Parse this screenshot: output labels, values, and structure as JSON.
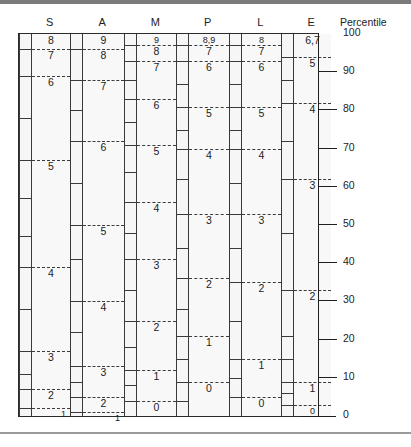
{
  "chart_data": {
    "type": "table",
    "title": "",
    "axis_title": "Percentile",
    "ylabel": "Percentile",
    "ylim": [
      0,
      100
    ],
    "yticks": [
      0,
      10,
      20,
      30,
      40,
      50,
      60,
      70,
      80,
      90,
      100
    ],
    "ytick_labels": [
      "0",
      "10",
      "20",
      "30",
      "40",
      "50",
      "60",
      "70",
      "80",
      "90",
      "100"
    ],
    "grid": false,
    "legend": "none",
    "categories": [
      "S",
      "A",
      "M",
      "P",
      "L",
      "E"
    ],
    "series": [
      {
        "name": "S",
        "bands": [
          {
            "label": "8",
            "top_pct": 100,
            "bottom_pct": 96
          },
          {
            "label": "7",
            "top_pct": 96,
            "bottom_pct": 89
          },
          {
            "label": "6",
            "top_pct": 89,
            "bottom_pct": 67
          },
          {
            "label": "5",
            "top_pct": 67,
            "bottom_pct": 39
          },
          {
            "label": "4",
            "top_pct": 39,
            "bottom_pct": 17
          },
          {
            "label": "3",
            "top_pct": 17,
            "bottom_pct": 7
          },
          {
            "label": "2",
            "top_pct": 7,
            "bottom_pct": 2
          },
          {
            "label": "1",
            "top_pct": 2,
            "bottom_pct": 0
          }
        ]
      },
      {
        "name": "A",
        "bands": [
          {
            "label": "9",
            "top_pct": 100,
            "bottom_pct": 96
          },
          {
            "label": "8",
            "top_pct": 96,
            "bottom_pct": 88
          },
          {
            "label": "7",
            "top_pct": 88,
            "bottom_pct": 72
          },
          {
            "label": "6",
            "top_pct": 72,
            "bottom_pct": 50
          },
          {
            "label": "5",
            "top_pct": 50,
            "bottom_pct": 30
          },
          {
            "label": "4",
            "top_pct": 30,
            "bottom_pct": 13
          },
          {
            "label": "3",
            "top_pct": 13,
            "bottom_pct": 5
          },
          {
            "label": "2",
            "top_pct": 5,
            "bottom_pct": 1
          },
          {
            "label": "1",
            "top_pct": 1,
            "bottom_pct": 0
          }
        ]
      },
      {
        "name": "M",
        "bands": [
          {
            "label": "9",
            "top_pct": 100,
            "bottom_pct": 97
          },
          {
            "label": "8",
            "top_pct": 97,
            "bottom_pct": 93
          },
          {
            "label": "7",
            "top_pct": 93,
            "bottom_pct": 83
          },
          {
            "label": "6",
            "top_pct": 83,
            "bottom_pct": 71
          },
          {
            "label": "5",
            "top_pct": 71,
            "bottom_pct": 56
          },
          {
            "label": "4",
            "top_pct": 56,
            "bottom_pct": 41
          },
          {
            "label": "3",
            "top_pct": 41,
            "bottom_pct": 25
          },
          {
            "label": "2",
            "top_pct": 25,
            "bottom_pct": 12
          },
          {
            "label": "1",
            "top_pct": 12,
            "bottom_pct": 4
          },
          {
            "label": "0",
            "top_pct": 4,
            "bottom_pct": 0
          }
        ]
      },
      {
        "name": "P",
        "bands": [
          {
            "label": "8,9",
            "top_pct": 100,
            "bottom_pct": 97
          },
          {
            "label": "7",
            "top_pct": 97,
            "bottom_pct": 93
          },
          {
            "label": "6",
            "top_pct": 93,
            "bottom_pct": 81
          },
          {
            "label": "5",
            "top_pct": 81,
            "bottom_pct": 70
          },
          {
            "label": "4",
            "top_pct": 70,
            "bottom_pct": 53
          },
          {
            "label": "3",
            "top_pct": 53,
            "bottom_pct": 36
          },
          {
            "label": "2",
            "top_pct": 36,
            "bottom_pct": 21
          },
          {
            "label": "1",
            "top_pct": 21,
            "bottom_pct": 9
          },
          {
            "label": "0",
            "top_pct": 9,
            "bottom_pct": 0
          }
        ]
      },
      {
        "name": "L",
        "bands": [
          {
            "label": "8",
            "top_pct": 100,
            "bottom_pct": 97
          },
          {
            "label": "7",
            "top_pct": 97,
            "bottom_pct": 93
          },
          {
            "label": "6",
            "top_pct": 93,
            "bottom_pct": 81
          },
          {
            "label": "5",
            "top_pct": 81,
            "bottom_pct": 70
          },
          {
            "label": "4",
            "top_pct": 70,
            "bottom_pct": 53
          },
          {
            "label": "3",
            "top_pct": 53,
            "bottom_pct": 35
          },
          {
            "label": "2",
            "top_pct": 35,
            "bottom_pct": 15
          },
          {
            "label": "1",
            "top_pct": 15,
            "bottom_pct": 5
          },
          {
            "label": "0",
            "top_pct": 5,
            "bottom_pct": 0
          }
        ]
      },
      {
        "name": "E",
        "bands": [
          {
            "label": "6,7",
            "top_pct": 100,
            "bottom_pct": 94
          },
          {
            "label": "5",
            "top_pct": 94,
            "bottom_pct": 82
          },
          {
            "label": "4",
            "top_pct": 82,
            "bottom_pct": 62
          },
          {
            "label": "3",
            "top_pct": 62,
            "bottom_pct": 33
          },
          {
            "label": "2",
            "top_pct": 33,
            "bottom_pct": 9
          },
          {
            "label": "1",
            "top_pct": 9,
            "bottom_pct": 3
          },
          {
            "label": "0",
            "top_pct": 3,
            "bottom_pct": 0
          }
        ]
      }
    ],
    "tick_strip_marks_pct": {
      "S": [
        96,
        89,
        78,
        67,
        57,
        47,
        39,
        28,
        17,
        11,
        7,
        2
      ],
      "A": [
        96,
        88,
        80,
        72,
        61,
        50,
        41,
        30,
        22,
        13,
        9,
        5,
        1
      ],
      "M": [
        97,
        93,
        88,
        83,
        77,
        71,
        64,
        56,
        48,
        41,
        33,
        25,
        18,
        12,
        8,
        4
      ],
      "P": [
        97,
        93,
        87,
        81,
        75,
        70,
        62,
        53,
        44,
        36,
        28,
        21,
        15,
        9,
        4
      ],
      "L": [
        97,
        93,
        87,
        81,
        75,
        70,
        61,
        53,
        44,
        35,
        25,
        15,
        10,
        5
      ],
      "E": [
        94,
        88,
        82,
        72,
        62,
        48,
        33,
        21,
        15,
        9,
        6,
        3
      ]
    }
  },
  "colors": {
    "frame": "#2b2b2b",
    "dashed_rule": "#3c3c3c",
    "axis": "#1f1f1f",
    "band_fill": "#f8f8f8",
    "text": "#222222"
  }
}
